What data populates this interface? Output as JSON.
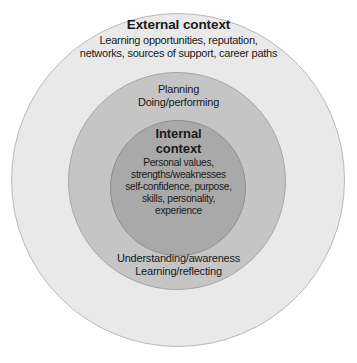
{
  "diagram": {
    "type": "concentric-circles",
    "background_color": "#ffffff",
    "layers": [
      {
        "id": "external",
        "name": "External context",
        "heading": "External context",
        "heading_bold": true,
        "fill_color": "#e9e9e9",
        "stroke_color": "#b9b9b9",
        "lines": [
          "Learning opportunities, reputation,",
          "networks, sources of support, career paths"
        ]
      },
      {
        "id": "middle",
        "name": "Process layer",
        "heading": "",
        "fill_color": "#c5c5c5",
        "stroke_color": "#a6a6a6",
        "top_lines": [
          "Planning",
          "Doing/performing"
        ],
        "bottom_lines": [
          "Understanding/awareness",
          "Learning/reflecting"
        ]
      },
      {
        "id": "internal",
        "name": "Internal context",
        "heading_line_1": "Internal",
        "heading_line_2": "context",
        "heading_bold": true,
        "fill_color": "#a9a9a9",
        "stroke_color": "#8e8e8e",
        "lines": [
          "Personal values,",
          "strengths/weaknesses",
          "self-confidence, purpose,",
          "skills, personality,",
          "experience"
        ]
      }
    ]
  }
}
